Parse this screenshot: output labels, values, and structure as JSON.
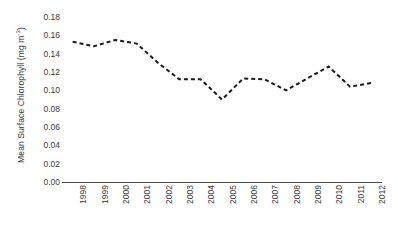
{
  "chart_data": {
    "type": "line",
    "title": "",
    "xlabel": "",
    "ylabel": "Mean Surface Chlorophyll (mg m-3)",
    "ylabel_text": "Mean Surface Chlorophyll (mg m",
    "ylabel_sup": "-3",
    "ylabel_tail": ")",
    "categories": [
      "1998",
      "1999",
      "2000",
      "2001",
      "2002",
      "2003",
      "2004",
      "2005",
      "2006",
      "2007",
      "2008",
      "2009",
      "2010",
      "2011",
      "2012"
    ],
    "values": [
      0.153,
      0.148,
      0.155,
      0.151,
      0.13,
      0.112,
      0.112,
      0.09,
      0.113,
      0.112,
      0.1,
      0.113,
      0.126,
      0.104,
      0.108
    ],
    "x": [
      1998,
      1999,
      2000,
      2001,
      2002,
      2003,
      2004,
      2005,
      2006,
      2007,
      2008,
      2009,
      2010,
      2011,
      2012
    ],
    "ylim": [
      0.0,
      0.18
    ],
    "xlim": [
      1998,
      2012
    ],
    "y_ticks": [
      "0.18",
      "0.16",
      "0.14",
      "0.12",
      "0.10",
      "0.08",
      "0.06",
      "0.04",
      "0.02",
      "0.00"
    ],
    "y_tick_values": [
      0.18,
      0.16,
      0.14,
      0.12,
      0.1,
      0.08,
      0.06,
      0.04,
      0.02,
      0.0
    ],
    "grid": false,
    "legend": "none",
    "series": [
      {
        "name": "Mean Surface Chlorophyll",
        "values": [
          0.153,
          0.148,
          0.155,
          0.151,
          0.13,
          0.112,
          0.112,
          0.09,
          0.113,
          0.112,
          0.1,
          0.113,
          0.126,
          0.104,
          0.108
        ],
        "line_style": "dashed",
        "color": "#1a1a1a"
      }
    ],
    "style": {
      "line_color": "#1a1a1a",
      "line_width": 2,
      "dash_pattern": "4 3",
      "axis_color": "#4a4a4a",
      "tick_label_color": "#3a3a3a",
      "background": "#ffffff"
    }
  }
}
